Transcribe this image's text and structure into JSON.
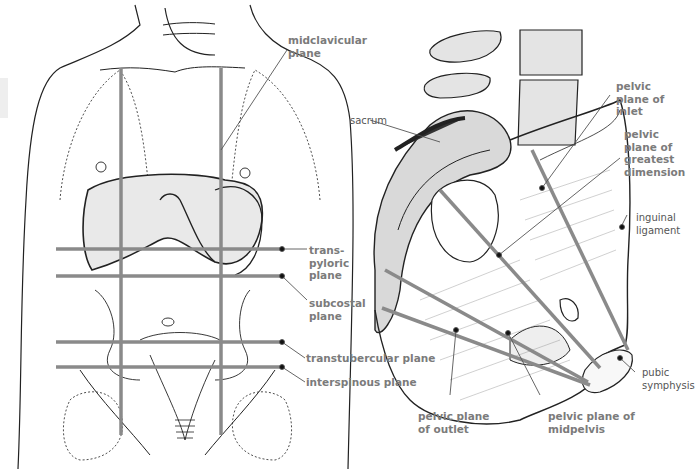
{
  "figure": {
    "left_panel": {
      "subject": "anterior abdomen with surface planes",
      "labels": {
        "midclavicular": "midclavicular\nplane",
        "transpyloric": "trans-\npyloric\nplane",
        "subcostal": "subcostal\nplane",
        "transtubercular": "transtubercular plane",
        "interspinous": "interspinous plane"
      }
    },
    "right_panel": {
      "subject": "sagittal pelvis with pelvic planes",
      "labels": {
        "sacrum": "sacrum",
        "inlet": "pelvic\nplane of\ninlet",
        "greatest": "pelvic\nplane of\ngreatest\ndimension",
        "inguinal": "inguinal\nligament",
        "pubic": "pubic\nsymphysis",
        "outlet": "pelvic plane\nof outlet",
        "midpelvis": "pelvic plane of\nmidpelvis"
      }
    },
    "colors": {
      "plane_line": "#8a8a8a",
      "label_text": "#7b7b7b",
      "drawing_ink": "#222222"
    }
  }
}
